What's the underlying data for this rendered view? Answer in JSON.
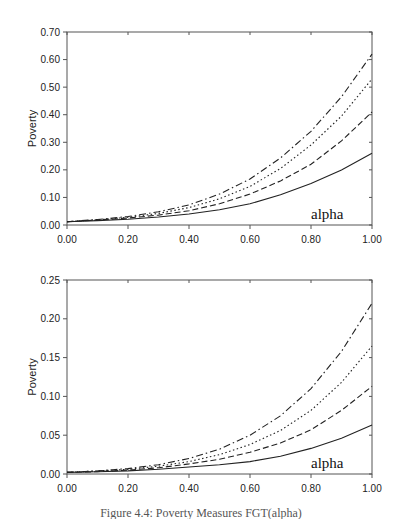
{
  "chart_data": [
    {
      "type": "line",
      "title": "",
      "xlabel": "",
      "ylabel": "Poverty",
      "annotation": "alpha",
      "xlim": [
        0,
        1
      ],
      "ylim": [
        0,
        0.7
      ],
      "x_ticks": [
        "0.00",
        "0.20",
        "0.40",
        "0.60",
        "0.80",
        "1.00"
      ],
      "y_ticks": [
        "0.00",
        "0.10",
        "0.20",
        "0.30",
        "0.40",
        "0.50",
        "0.60",
        "0.70"
      ],
      "grid": false,
      "legend": null,
      "x": [
        0.0,
        0.1,
        0.2,
        0.3,
        0.4,
        0.5,
        0.6,
        0.7,
        0.8,
        0.9,
        1.0
      ],
      "series": [
        {
          "name": "solid",
          "style": "solid",
          "values": [
            0.012,
            0.016,
            0.021,
            0.029,
            0.04,
            0.055,
            0.077,
            0.11,
            0.15,
            0.2,
            0.26
          ]
        },
        {
          "name": "dashed",
          "style": "dashed",
          "values": [
            0.012,
            0.018,
            0.025,
            0.036,
            0.052,
            0.077,
            0.112,
            0.16,
            0.22,
            0.305,
            0.41
          ]
        },
        {
          "name": "dotted",
          "style": "dotted",
          "values": [
            0.012,
            0.019,
            0.028,
            0.042,
            0.063,
            0.095,
            0.14,
            0.205,
            0.29,
            0.395,
            0.53
          ]
        },
        {
          "name": "dash-dot",
          "style": "dashdot",
          "values": [
            0.012,
            0.02,
            0.031,
            0.048,
            0.073,
            0.112,
            0.167,
            0.243,
            0.34,
            0.465,
            0.62
          ]
        }
      ]
    },
    {
      "type": "line",
      "title": "",
      "xlabel": "",
      "ylabel": "Poverty",
      "annotation": "alpha",
      "xlim": [
        0,
        1
      ],
      "ylim": [
        0,
        0.25
      ],
      "x_ticks": [
        "0.00",
        "0.20",
        "0.40",
        "0.60",
        "0.80",
        "1.00"
      ],
      "y_ticks": [
        "0.00",
        "0.05",
        "0.10",
        "0.15",
        "0.20",
        "0.25"
      ],
      "grid": false,
      "legend": null,
      "x": [
        0.0,
        0.1,
        0.2,
        0.3,
        0.4,
        0.5,
        0.6,
        0.7,
        0.8,
        0.9,
        1.0
      ],
      "series": [
        {
          "name": "solid",
          "style": "solid",
          "values": [
            0.002,
            0.003,
            0.004,
            0.006,
            0.009,
            0.012,
            0.016,
            0.023,
            0.033,
            0.046,
            0.063
          ]
        },
        {
          "name": "dashed",
          "style": "dashed",
          "values": [
            0.002,
            0.003,
            0.005,
            0.008,
            0.013,
            0.019,
            0.028,
            0.04,
            0.057,
            0.082,
            0.113
          ]
        },
        {
          "name": "dotted",
          "style": "dotted",
          "values": [
            0.002,
            0.004,
            0.006,
            0.01,
            0.016,
            0.025,
            0.038,
            0.056,
            0.082,
            0.118,
            0.165
          ]
        },
        {
          "name": "dash-dot",
          "style": "dashdot",
          "values": [
            0.002,
            0.004,
            0.007,
            0.012,
            0.02,
            0.032,
            0.05,
            0.075,
            0.11,
            0.158,
            0.22
          ]
        }
      ]
    }
  ],
  "caption": "Figure 4.4: Poverty Measures FGT(alpha)"
}
